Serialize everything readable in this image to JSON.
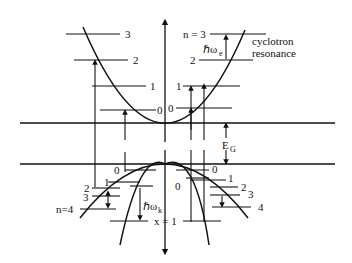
{
  "diagram": {
    "title": "",
    "energy_gap_label": "E",
    "energy_gap_subscript": "G",
    "conduction_band": {
      "left_levels": [
        "0",
        "1",
        "2",
        "3"
      ],
      "right_levels": [
        "0",
        "1",
        "2",
        "n = 3"
      ],
      "transition_label": "ℏω",
      "transition_subscript": "e",
      "annotation_line1": "cyclotron",
      "annotation_line2": "resonance"
    },
    "valence_band": {
      "heavy_left_levels": [
        "0",
        "1",
        "2",
        "3",
        "n=4"
      ],
      "heavy_right_levels": [
        "0",
        "1",
        "2",
        "3",
        "4"
      ],
      "light_levels": [
        "0",
        "x = 1"
      ],
      "transition_label": "ℏω",
      "transition_subscript": "k"
    }
  }
}
